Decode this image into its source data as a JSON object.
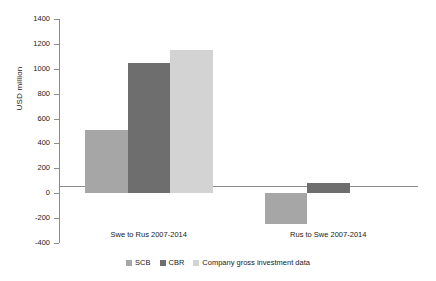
{
  "chart_data": {
    "type": "bar",
    "title": "",
    "xlabel": "",
    "ylabel": "USD million",
    "ylim": [
      -400,
      1400
    ],
    "ytick_step": 200,
    "yticks": [
      "1400",
      "1200",
      "1000",
      "800",
      "600",
      "400",
      "200",
      "0",
      "-200",
      "-400"
    ],
    "grid": false,
    "legend_position": "bottom",
    "categories": [
      "Swe to Rus 2007-2014",
      "Rus to Swe 2007-2014"
    ],
    "series": [
      {
        "name": "SCB",
        "color": "#a6a6a6",
        "values": [
          510,
          -250
        ]
      },
      {
        "name": "CBR",
        "color": "#6e6e6e",
        "values": [
          1050,
          85
        ]
      },
      {
        "name": "Company gross investment data",
        "color": "#d3d3d3",
        "values": [
          1150,
          0
        ]
      }
    ]
  },
  "legend": {
    "items": [
      {
        "label": "SCB",
        "color": "#a6a6a6"
      },
      {
        "label": "CBR",
        "color": "#6e6e6e"
      },
      {
        "label": "Company gross investment data",
        "color": "#d3d3d3"
      }
    ]
  }
}
